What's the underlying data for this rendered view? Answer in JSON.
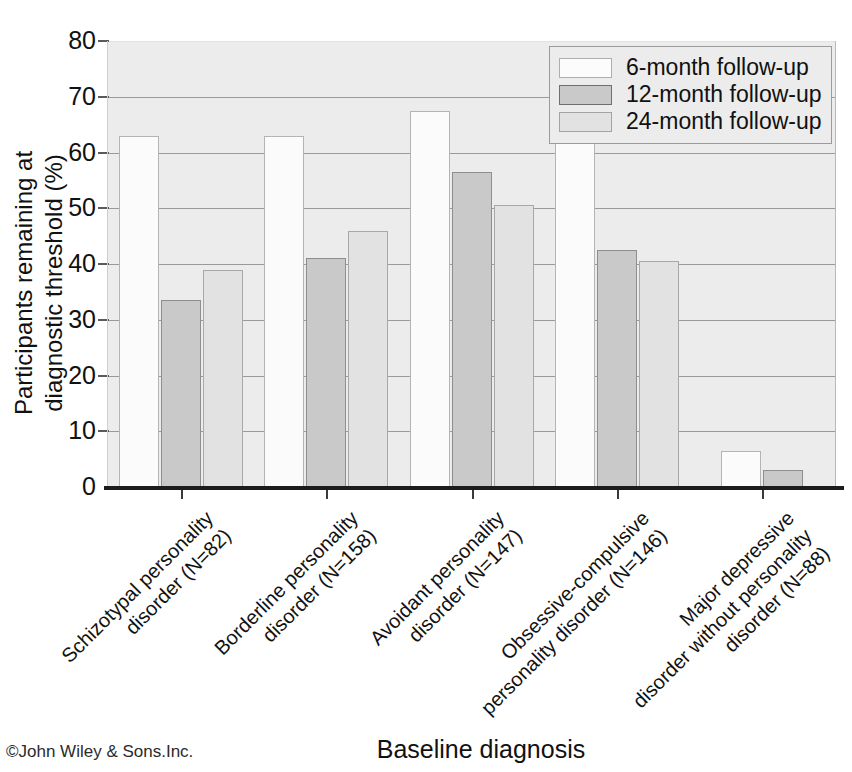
{
  "chart_data": {
    "type": "bar",
    "title": "",
    "xlabel": "Baseline diagnosis",
    "ylabel": "Participants remaining at\ndiagnostic threshold (%)",
    "ylabel_line1": "Participants remaining at",
    "ylabel_line2": "diagnostic threshold (%)",
    "ylim": [
      0,
      80
    ],
    "yticks": [
      0,
      10,
      20,
      30,
      40,
      50,
      60,
      70,
      80
    ],
    "ytick_labels": [
      "0",
      "10",
      "20",
      "30",
      "40",
      "50",
      "60",
      "70",
      "80"
    ],
    "grid": true,
    "legend_position": "top-right",
    "categories": [
      "Schizotypal personality\ndisorder (N=82)",
      "Borderline personality\ndisorder (N=158)",
      "Avoidant personality\ndisorder (N=147)",
      "Obsessive-compulsive\npersonality disorder (N=146)",
      "Major depressive\ndisorder without personality\ndisorder (N=88)"
    ],
    "category_lines": [
      [
        "Schizotypal personality",
        "disorder (N=82)"
      ],
      [
        "Borderline personality",
        "disorder (N=158)"
      ],
      [
        "Avoidant personality",
        "disorder (N=147)"
      ],
      [
        "Obsessive-compulsive",
        "personality disorder (N=146)"
      ],
      [
        "Major depressive",
        "disorder without personality",
        "disorder (N=88)"
      ]
    ],
    "series": [
      {
        "name": "6-month follow-up",
        "color": "#fbfbfb",
        "values": [
          63,
          63,
          67.5,
          63,
          6.5
        ]
      },
      {
        "name": "12-month follow-up",
        "color": "#c9c9c9",
        "values": [
          33.5,
          41,
          56.5,
          42.5,
          3
        ]
      },
      {
        "name": "24-month follow-up",
        "color": "#e2e2e2",
        "values": [
          39,
          46,
          50.5,
          40.5,
          null
        ]
      }
    ]
  },
  "legend": {
    "items": [
      {
        "label": "6-month follow-up",
        "swatch": "s6"
      },
      {
        "label": "12-month follow-up",
        "swatch": "s12"
      },
      {
        "label": "24-month follow-up",
        "swatch": "s24"
      }
    ]
  },
  "credit": "©John Wiley & Sons.Inc.",
  "colors": {
    "series_6_month": "#fbfbfb",
    "series_12_month": "#c9c9c9",
    "series_24_month": "#e2e2e2",
    "plot_background": "#ececec",
    "gridline": "#9a9a9a",
    "axis": "#1c1c1c"
  }
}
